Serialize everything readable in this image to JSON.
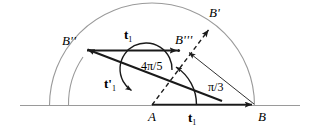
{
  "figure": {
    "type": "geometric-vector-diagram",
    "background_color": "#ffffff",
    "stroke_color": "#1a1a1a",
    "arc_color": "#8a8a8a",
    "baseline_color": "#8a8a8a",
    "points": {
      "A": {
        "label": "A",
        "x": 152,
        "y": 105
      },
      "B": {
        "label": "B",
        "x": 255,
        "y": 105
      },
      "B_prime": {
        "label": "B",
        "primes": "'",
        "x": 207,
        "y": 28
      },
      "B_dprime": {
        "label": "B",
        "primes": "''",
        "x": 85,
        "y": 50
      },
      "B_tprime": {
        "label": "B",
        "primes": "'''",
        "x": 178,
        "y": 52
      }
    },
    "labels": {
      "point_a": "A",
      "point_b": "B",
      "point_b_prime": "B",
      "point_b_prime_marks": "'",
      "point_b_double_prime": "B",
      "point_b_double_prime_marks": "''",
      "point_b_triple_prime": "B",
      "point_b_triple_prime_marks": "'''",
      "vector_t1_bottom": "t",
      "vector_t1_bottom_sub": "1",
      "vector_t1_top": "t",
      "vector_t1_top_sub": "1",
      "vector_t1_prime": "t",
      "vector_t1_prime_marks": "'",
      "vector_t1_prime_sub": "1",
      "angle_large": "4π/5",
      "angle_small": "π/3"
    },
    "angles": {
      "large": {
        "text": "4π/5",
        "value_rad": "4π/5",
        "vertex": "A"
      },
      "small": {
        "text": "π/3",
        "value_rad": "π/3",
        "vertex": "A"
      }
    },
    "vectors": [
      {
        "name": "t1",
        "label": "t",
        "subscript": "1",
        "from": "A",
        "to": "B",
        "style": "solid-thick-arrow"
      },
      {
        "name": "t1-top",
        "label": "t",
        "subscript": "1",
        "from": "B''",
        "to": "B'''",
        "style": "solid-thick-arrow"
      },
      {
        "name": "t1-prime",
        "label": "t",
        "subscript": "1",
        "primes": "'",
        "from": "B",
        "to": "B''",
        "style": "solid-thick-arrow"
      }
    ]
  }
}
